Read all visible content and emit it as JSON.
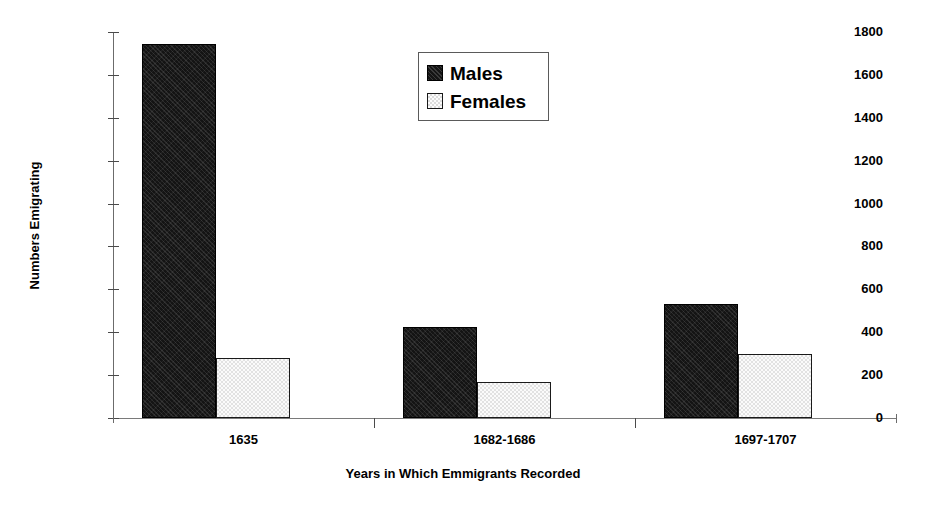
{
  "chart_data": {
    "type": "bar",
    "title": "",
    "xlabel": "Years in Which Emmigrants Recorded",
    "ylabel": "Numbers Emigrating",
    "categories": [
      "1635",
      "1682-1686",
      "1697-1707"
    ],
    "series": [
      {
        "name": "Males",
        "values": [
          1745,
          425,
          530
        ]
      },
      {
        "name": "Females",
        "values": [
          280,
          170,
          300
        ]
      }
    ],
    "ylim": [
      0,
      1800
    ],
    "ytick_labels": [
      "0",
      "200",
      "400",
      "600",
      "800",
      "1000",
      "1200",
      "1400",
      "1600",
      "1800"
    ],
    "ytick_values": [
      0,
      200,
      400,
      600,
      800,
      1000,
      1200,
      1400,
      1600,
      1800
    ],
    "grid": false,
    "legend_position": "top-center",
    "legend_entries": [
      "Males",
      "Females"
    ],
    "colors": {
      "males": "#141414",
      "females": "#f2f2f2",
      "axis": "#4a4a4a",
      "text": "#000000",
      "background": "#ffffff"
    }
  }
}
